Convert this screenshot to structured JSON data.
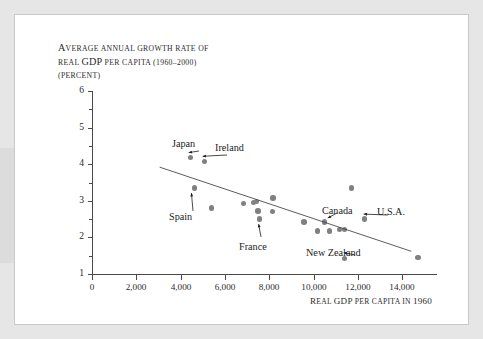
{
  "figure": {
    "title_lines": [
      "AVERAGE ANNUAL GROWTH RATE OF",
      "REAL GDP PER CAPITA (1960–2000)",
      "(PERCENT)"
    ],
    "title_full": "AVERAGE ANNUAL GROWTH RATE OF REAL GDP PER CAPITA (1960–2000) (PERCENT)",
    "colors": {
      "page_background": "#e6e6e6",
      "card_background": "#ffffff",
      "axis": "#4a4a4a",
      "dot": "#808080",
      "trendline": "#4a4a4a",
      "text": "#1d1d1d"
    }
  },
  "chart_data": {
    "type": "scatter",
    "title": "AVERAGE ANNUAL GROWTH RATE OF REAL GDP PER CAPITA (1960–2000) (PERCENT)",
    "xlabel": "REAL GDP PER CAPITA IN 1960",
    "ylabel": "AVERAGE ANNUAL GROWTH RATE OF REAL GDP PER CAPITA (1960–2000) (PERCENT)",
    "xlim": [
      0,
      15200
    ],
    "ylim": [
      1,
      6
    ],
    "grid": false,
    "legend": "none",
    "xticks": [
      0,
      2000,
      4000,
      6000,
      8000,
      10000,
      12000,
      14000
    ],
    "xtick_labels": [
      "0",
      "2,000",
      "4,000",
      "6,000",
      "8,000",
      "10,000",
      "12,000",
      "14,000"
    ],
    "yticks": [
      1,
      2,
      3,
      4,
      5,
      6
    ],
    "ytick_labels": [
      "1",
      "2",
      "3",
      "4",
      "5",
      "6"
    ],
    "yminor_ticks": [
      1.5,
      2.5,
      3.5,
      4.5,
      5.5
    ],
    "points": [
      {
        "x": 4450,
        "y": 4.18,
        "label": "Japan"
      },
      {
        "x": 5080,
        "y": 4.08,
        "label": "Ireland"
      },
      {
        "x": 4620,
        "y": 3.35,
        "label": "Spain"
      },
      {
        "x": 5380,
        "y": 2.8,
        "label": ""
      },
      {
        "x": 6820,
        "y": 2.92,
        "label": ""
      },
      {
        "x": 7280,
        "y": 2.96,
        "label": ""
      },
      {
        "x": 7430,
        "y": 2.98,
        "label": ""
      },
      {
        "x": 7480,
        "y": 2.72,
        "label": ""
      },
      {
        "x": 7560,
        "y": 2.5,
        "label": "France"
      },
      {
        "x": 8170,
        "y": 3.08,
        "label": ""
      },
      {
        "x": 8130,
        "y": 2.7,
        "label": ""
      },
      {
        "x": 9570,
        "y": 2.42,
        "label": ""
      },
      {
        "x": 10180,
        "y": 2.18,
        "label": ""
      },
      {
        "x": 10500,
        "y": 2.42,
        "label": "Canada"
      },
      {
        "x": 10700,
        "y": 2.18,
        "label": ""
      },
      {
        "x": 11150,
        "y": 2.22,
        "label": ""
      },
      {
        "x": 11400,
        "y": 2.22,
        "label": ""
      },
      {
        "x": 11700,
        "y": 3.35,
        "label": ""
      },
      {
        "x": 11400,
        "y": 1.42,
        "label": "New Zealand"
      },
      {
        "x": 12300,
        "y": 2.5,
        "label": "U.S.A."
      },
      {
        "x": 14700,
        "y": 1.45,
        "label": ""
      }
    ],
    "trendline": {
      "x_start": 3050,
      "y_start": 3.92,
      "x_end": 14400,
      "y_end": 1.62
    },
    "annotations": [
      {
        "text": "Japan",
        "point_x": 4450,
        "point_y": 4.18
      },
      {
        "text": "Ireland",
        "point_x": 5080,
        "point_y": 4.08
      },
      {
        "text": "Spain",
        "point_x": 4620,
        "point_y": 3.35
      },
      {
        "text": "France",
        "point_x": 7560,
        "point_y": 2.5
      },
      {
        "text": "Canada",
        "point_x": 10500,
        "point_y": 2.42
      },
      {
        "text": "U.S.A.",
        "point_x": 12300,
        "point_y": 2.5
      },
      {
        "text": "New Zealand",
        "point_x": 11400,
        "point_y": 1.42
      }
    ]
  }
}
